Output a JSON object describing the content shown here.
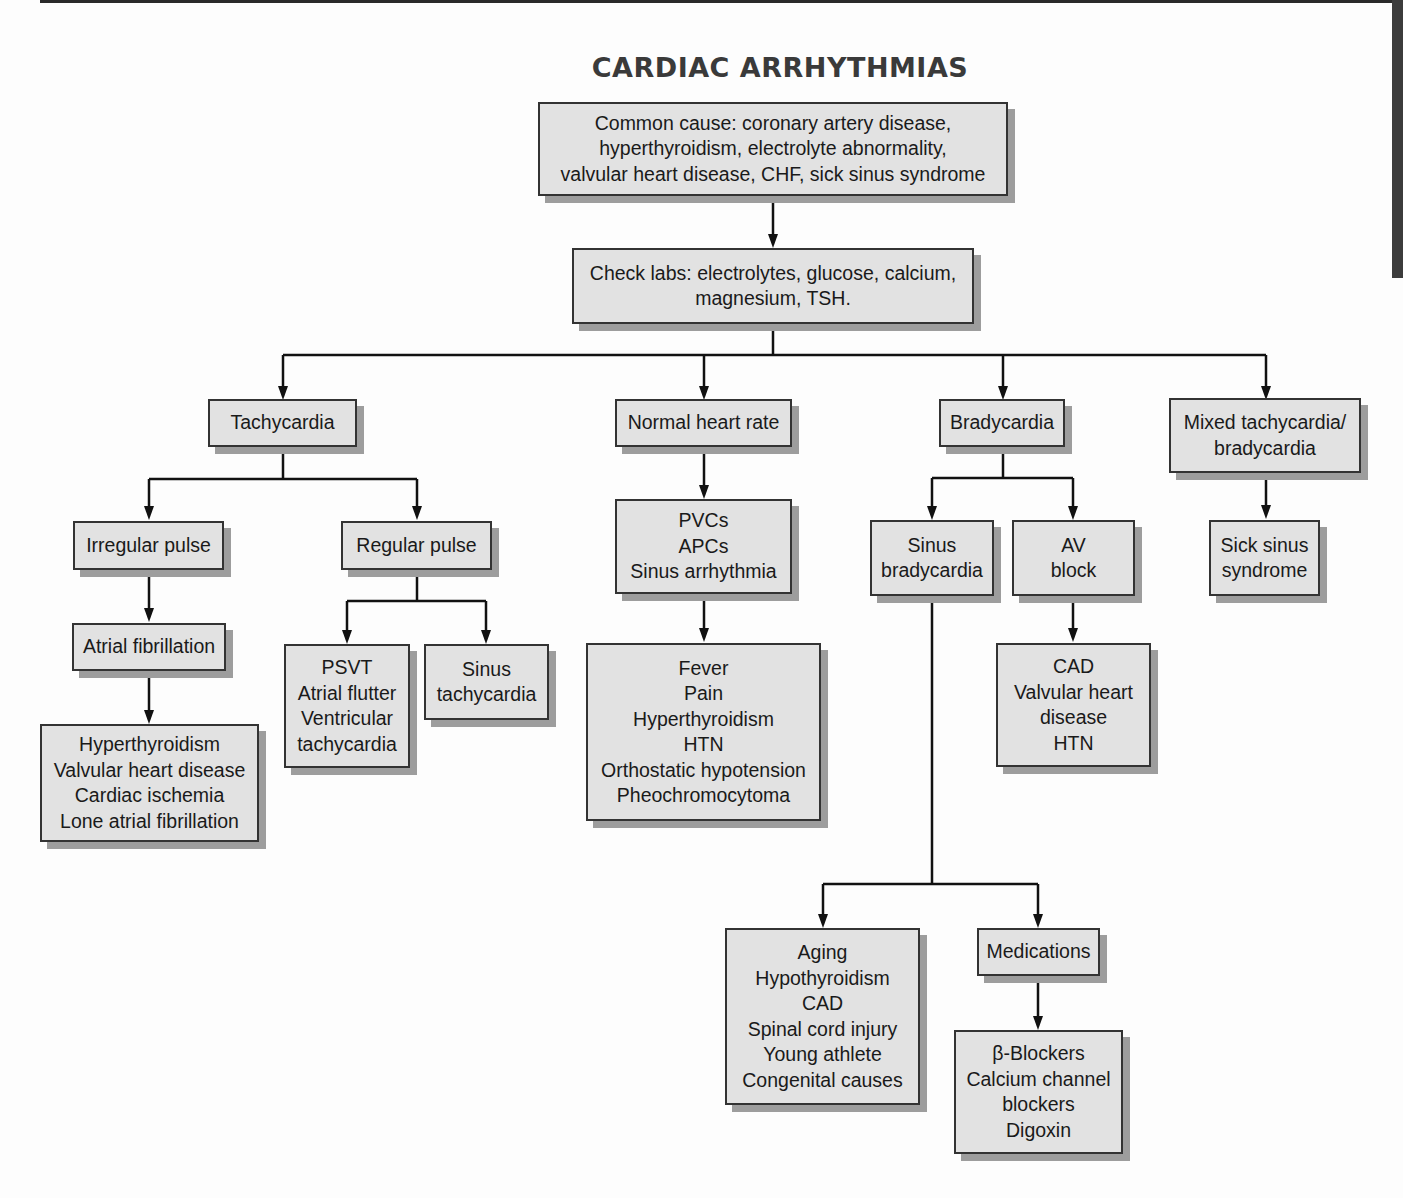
{
  "title": "CARDIAC ARRHYTHMIAS",
  "nodes": {
    "common_cause": {
      "lines": [
        "Common cause: coronary artery disease,",
        "hyperthyroidism, electrolyte abnormality,",
        "valvular heart disease, CHF, sick sinus syndrome"
      ]
    },
    "check_labs": {
      "lines": [
        "Check labs: electrolytes, glucose, calcium,",
        "magnesium, TSH."
      ]
    },
    "tachycardia": {
      "lines": [
        "Tachycardia"
      ]
    },
    "normal_heart_rate": {
      "lines": [
        "Normal heart rate"
      ]
    },
    "bradycardia": {
      "lines": [
        "Bradycardia"
      ]
    },
    "mixed": {
      "lines": [
        "Mixed tachycardia/",
        "bradycardia"
      ]
    },
    "irregular_pulse": {
      "lines": [
        "Irregular pulse"
      ]
    },
    "regular_pulse": {
      "lines": [
        "Regular pulse"
      ]
    },
    "atrial_fibrillation": {
      "lines": [
        "Atrial fibrillation"
      ]
    },
    "afib_causes": {
      "lines": [
        "Hyperthyroidism",
        "Valvular heart disease",
        "Cardiac ischemia",
        "Lone atrial fibrillation"
      ]
    },
    "psvt_group": {
      "lines": [
        "PSVT",
        "Atrial flutter",
        "Ventricular",
        "tachycardia"
      ]
    },
    "sinus_tachycardia": {
      "lines": [
        "Sinus",
        "tachycardia"
      ]
    },
    "normal_types": {
      "lines": [
        "PVCs",
        "APCs",
        "Sinus arrhythmia"
      ]
    },
    "normal_causes": {
      "lines": [
        "Fever",
        "Pain",
        "Hyperthyroidism",
        "HTN",
        "Orthostatic hypotension",
        "Pheochromocytoma"
      ]
    },
    "sinus_bradycardia": {
      "lines": [
        "Sinus",
        "bradycardia"
      ]
    },
    "av_block": {
      "lines": [
        "AV",
        "block"
      ]
    },
    "av_block_causes": {
      "lines": [
        "CAD",
        "Valvular heart",
        "disease",
        "HTN"
      ]
    },
    "sick_sinus": {
      "lines": [
        "Sick sinus",
        "syndrome"
      ]
    },
    "sinus_brady_causes": {
      "lines": [
        "Aging",
        "Hypothyroidism",
        "CAD",
        "Spinal cord injury",
        "Young athlete",
        "Congenital causes"
      ]
    },
    "medications": {
      "lines": [
        "Medications"
      ]
    },
    "medication_list": {
      "lines": [
        "β-Blockers",
        "Calcium channel",
        "blockers",
        "Digoxin"
      ]
    }
  },
  "colors": {
    "box_fill": "#e2e2e2",
    "box_border": "#333333",
    "shadow": "#9d9d9d",
    "line": "#111111",
    "title": "#3a3a3a"
  }
}
